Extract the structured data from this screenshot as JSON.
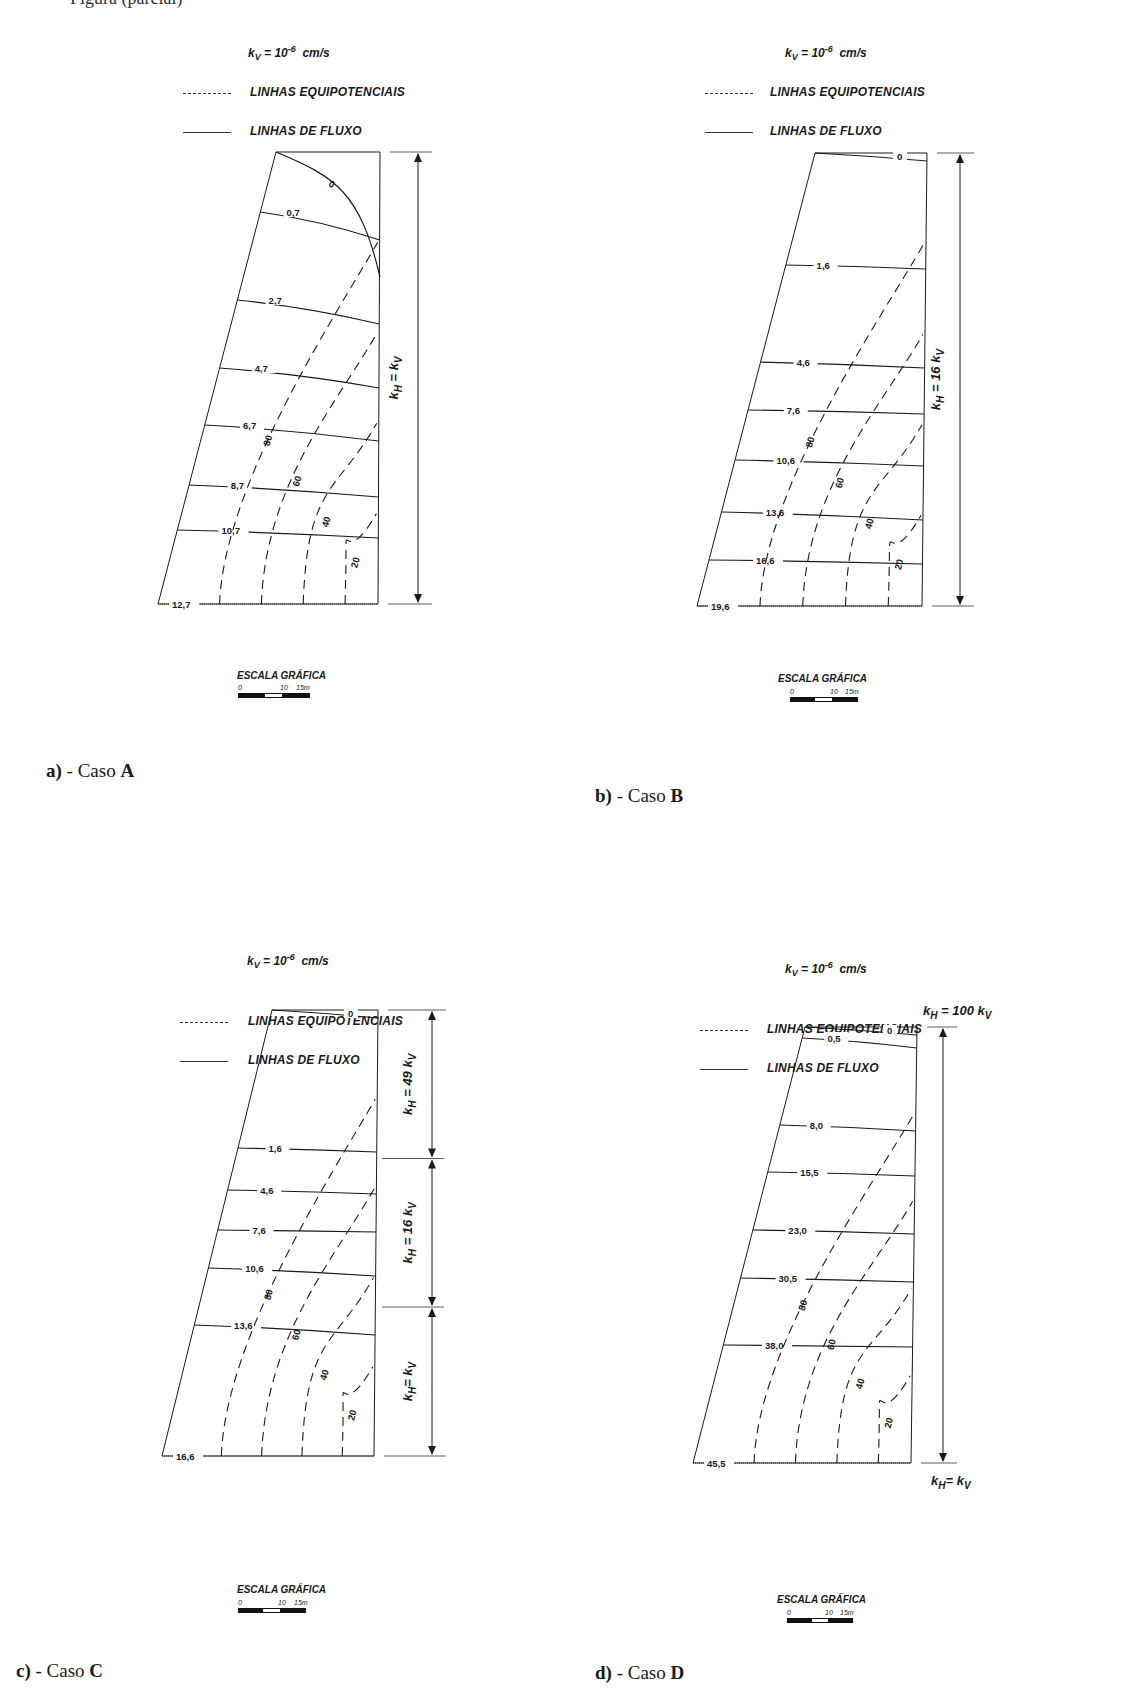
{
  "page": {
    "cut_header_text": "Figura (parcial)",
    "legend": {
      "kv_symbol": "k",
      "kv_sub": "V",
      "kv_eq": " = 10",
      "kv_exp": "-6",
      "kv_unit": "  cm/s",
      "equipotential_label": "LINHAS EQUIPOTENCIAIS",
      "flow_label": "LINHAS DE FLUXO"
    },
    "scale": {
      "title": "ESCALA GRÁFICA",
      "ticks": [
        "0",
        "10",
        "15m"
      ]
    },
    "colors": {
      "ink": "#1a1a1a",
      "paper": "#ffffff"
    }
  },
  "panels": [
    {
      "id": "a",
      "caption_prefix": "a)",
      "caption_mid": " - Caso ",
      "caption_case": "A",
      "flow_lines": [
        "0",
        "0,7",
        "2,7",
        "4,7",
        "6,7",
        "8,7",
        "10,7",
        "12,7"
      ],
      "equipotentials": [
        "80",
        "60",
        "40",
        "20"
      ],
      "zones": [
        {
          "label_k": "k",
          "label_sub": "H",
          "label_rest": " = k",
          "label_sub2": "V",
          "fraction": 1.0
        }
      ]
    },
    {
      "id": "b",
      "caption_prefix": "b)",
      "caption_mid": " - Caso ",
      "caption_case": "B",
      "flow_lines": [
        "0",
        "1,6",
        "4,6",
        "7,6",
        "10,6",
        "13,6",
        "16,6",
        "19,6"
      ],
      "equipotentials": [
        "80",
        "60",
        "40",
        "20"
      ],
      "zones": [
        {
          "label_k": "k",
          "label_sub": "H",
          "label_rest": " = 16 k",
          "label_sub2": "V",
          "fraction": 1.0
        }
      ]
    },
    {
      "id": "c",
      "caption_prefix": "c)",
      "caption_mid": " - Caso ",
      "caption_case": "C",
      "flow_lines": [
        "0",
        "1,6",
        "4,6",
        "7,6",
        "10,6",
        "13,6",
        "16,6"
      ],
      "equipotentials": [
        "80",
        "60",
        "40",
        "20"
      ],
      "zones": [
        {
          "label_k": "k",
          "label_sub": "H",
          "label_rest": " = 49 k",
          "label_sub2": "V",
          "fraction": 0.333
        },
        {
          "label_k": "k",
          "label_sub": "H",
          "label_rest": " = 16 k",
          "label_sub2": "V",
          "fraction": 0.333
        },
        {
          "label_k": "k",
          "label_sub": "H",
          "label_rest": "=  k",
          "label_sub2": "V",
          "fraction": 0.334
        }
      ]
    },
    {
      "id": "d",
      "caption_prefix": "d)",
      "caption_mid": " - Caso ",
      "caption_case": "D",
      "flow_lines": [
        "0",
        "0,5",
        "8,0",
        "15,5",
        "23,0",
        "30,5",
        "38,0",
        "45,5"
      ],
      "equipotentials": [
        "80",
        "60",
        "40",
        "20"
      ],
      "top_label": {
        "k": "k",
        "sub": "H",
        "rest": " = 100 k",
        "sub2": "V"
      },
      "bottom_label": {
        "k": "k",
        "sub": "H",
        "rest": "=  k",
        "sub2": "V"
      }
    }
  ]
}
